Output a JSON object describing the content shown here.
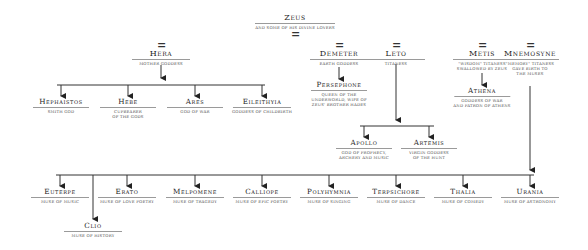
{
  "title": {
    "name": "Zeus",
    "subtitle": "AND SOME OF HIS DIVINE LOVERS",
    "marriage_symbol": "="
  },
  "lovers": [
    {
      "id": "hera",
      "name": "Hera",
      "desc": [
        "MOTHER GODDESS"
      ]
    },
    {
      "id": "demeter",
      "name": "Demeter",
      "desc": [
        "EARTH GODDESS"
      ]
    },
    {
      "id": "leto",
      "name": "Leto",
      "desc": [
        "TITANESS"
      ]
    },
    {
      "id": "metis",
      "name": "Metis",
      "desc": [
        "\"WISDOM\" TITANESS",
        "SWALLOWED BY ZEUS"
      ]
    },
    {
      "id": "mnemosyne",
      "name": "Mnemosyne",
      "desc": [
        "\"MEMORY\" TITANESS",
        "GAVE BIRTH TO",
        "THE MUSES"
      ]
    }
  ],
  "children_of_hera": [
    {
      "name": "Hephaistos",
      "desc": [
        "SMITH GOD"
      ]
    },
    {
      "name": "Hebe",
      "desc": [
        "CUPBEARER",
        "OF THE GODS"
      ]
    },
    {
      "name": "Ares",
      "desc": [
        "GOD OF WAR"
      ]
    },
    {
      "name": "Eileithyia",
      "desc": [
        "GODDESS OF CHILDBIRTH"
      ]
    }
  ],
  "children_of_demeter": [
    {
      "name": "Persephone",
      "desc": [
        "QUEEN OF THE",
        "UNDERWORLD, WIFE OF",
        "ZEUS' BROTHER HADES"
      ]
    }
  ],
  "children_of_leto": [
    {
      "name": "Apollo",
      "desc": [
        "GOD OF PROPHECY,",
        "ARCHERY AND MUSIC"
      ]
    },
    {
      "name": "Artemis",
      "desc": [
        "VIRGIN GODDESS",
        "OF THE HUNT"
      ]
    }
  ],
  "children_of_metis": [
    {
      "name": "Athena",
      "desc": [
        "GODDESS OF WAR",
        "AND PATRON OF ATHENS"
      ]
    }
  ],
  "muses": [
    {
      "name": "Euterpe",
      "desc": [
        "MUSE OF MUSIC"
      ]
    },
    {
      "name": "Clio",
      "desc": [
        "MUSE OF HISTORY"
      ]
    },
    {
      "name": "Erato",
      "desc": [
        "MUSE OF LOVE POETRY"
      ]
    },
    {
      "name": "Melpomene",
      "desc": [
        "MUSE OF TRAGEDY"
      ]
    },
    {
      "name": "Calliope",
      "desc": [
        "MUSE OF EPIC POETRY"
      ]
    },
    {
      "name": "Polyhymnia",
      "desc": [
        "MUSE OF SINGING"
      ]
    },
    {
      "name": "Terpsichore",
      "desc": [
        "MUSE OF DANCE"
      ]
    },
    {
      "name": "Thalia",
      "desc": [
        "MUSE OF COMEDY"
      ]
    },
    {
      "name": "Urania",
      "desc": [
        "MUSE OF ASTRONOMY"
      ]
    }
  ],
  "colors": {
    "line": "#333333",
    "rule": "#9a9a9a",
    "text": "#222222",
    "desc": "#555555"
  }
}
